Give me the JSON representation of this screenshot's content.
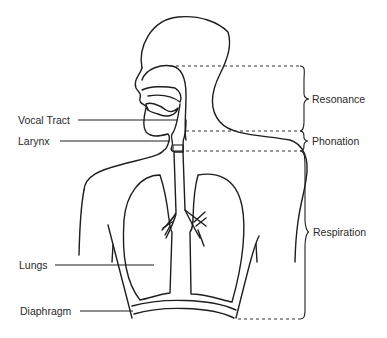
{
  "diagram": {
    "left_labels": [
      {
        "id": "vocal-tract",
        "text": "Vocal Tract"
      },
      {
        "id": "larynx",
        "text": "Larynx"
      },
      {
        "id": "lungs",
        "text": "Lungs"
      },
      {
        "id": "diaphragm",
        "text": "Diaphragm"
      }
    ],
    "right_labels": [
      {
        "id": "resonance",
        "text": "Resonance"
      },
      {
        "id": "phonation",
        "text": "Phonation"
      },
      {
        "id": "respiration",
        "text": "Respiration"
      }
    ],
    "colors": {
      "line": "#1e1e1e",
      "text": "#2a2a2a",
      "background": "#ffffff"
    }
  }
}
